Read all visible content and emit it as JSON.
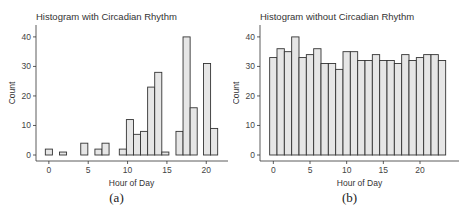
{
  "chart_data": [
    {
      "type": "bar",
      "title": "Histogram with Circadian Rhythm",
      "xlabel": "Hour of Day",
      "ylabel": "Count",
      "caption": "(a)",
      "xticks": [
        0,
        5,
        10,
        15,
        20
      ],
      "yticks": [
        0,
        10,
        20,
        30,
        40
      ],
      "xlim": [
        -1,
        22
      ],
      "ylim": [
        0,
        42
      ],
      "bin_width": 0.9,
      "grid": false,
      "bar_fill": "#e6e6e6",
      "bar_stroke": "#333333",
      "bins": [
        {
          "x": 0.0,
          "count": 2
        },
        {
          "x": 1.8,
          "count": 1
        },
        {
          "x": 4.5,
          "count": 4
        },
        {
          "x": 6.3,
          "count": 2
        },
        {
          "x": 7.2,
          "count": 4
        },
        {
          "x": 9.4,
          "count": 2
        },
        {
          "x": 10.3,
          "count": 12
        },
        {
          "x": 11.2,
          "count": 7
        },
        {
          "x": 12.1,
          "count": 8
        },
        {
          "x": 13.0,
          "count": 23
        },
        {
          "x": 13.9,
          "count": 28
        },
        {
          "x": 14.8,
          "count": 1
        },
        {
          "x": 16.6,
          "count": 8
        },
        {
          "x": 17.5,
          "count": 40
        },
        {
          "x": 18.4,
          "count": 16
        },
        {
          "x": 20.1,
          "count": 31
        },
        {
          "x": 21.0,
          "count": 9
        }
      ]
    },
    {
      "type": "bar",
      "title": "Histogram without Circadian Rhythm",
      "xlabel": "Hour of Day",
      "ylabel": "Count",
      "caption": "(b)",
      "xticks": [
        0,
        5,
        10,
        15,
        20
      ],
      "yticks": [
        0,
        10,
        20,
        30,
        40
      ],
      "xlim": [
        -1,
        24.5
      ],
      "ylim": [
        0,
        42
      ],
      "bin_width": 1,
      "grid": false,
      "bar_fill": "#e6e6e6",
      "bar_stroke": "#333333",
      "categories": [
        0,
        1,
        2,
        3,
        4,
        5,
        6,
        7,
        8,
        9,
        10,
        11,
        12,
        13,
        14,
        15,
        16,
        17,
        18,
        19,
        20,
        21,
        22,
        23
      ],
      "values": [
        33,
        36,
        35,
        40,
        33,
        34,
        36,
        31,
        31,
        29,
        35,
        35,
        32,
        32,
        34,
        32,
        32,
        31,
        34,
        32,
        33,
        34,
        34,
        32
      ]
    }
  ]
}
